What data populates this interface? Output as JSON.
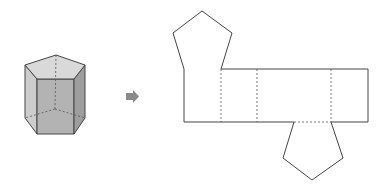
{
  "diagram": {
    "colors": {
      "stroke": "#444444",
      "dashed": "#666666",
      "arrow": "#8a8a8a",
      "face_top": "#d9d9d9",
      "face_left": "#cdcdcd",
      "face_front": "#b3b3b3",
      "face_right": "#9e9e9e"
    },
    "prism": {
      "label": "pentagonal-prism",
      "top_vertices": [
        [
          56,
          55
        ],
        [
          85,
          65
        ],
        [
          74,
          79
        ],
        [
          37,
          79
        ],
        [
          25,
          65
        ]
      ],
      "bottom_visible": [
        [
          25,
          118
        ],
        [
          37,
          134
        ],
        [
          74,
          134
        ],
        [
          85,
          118
        ]
      ],
      "hidden_vertex": [
        55,
        109
      ]
    },
    "arrow": {
      "label": "unfolds-to",
      "direction": "right"
    },
    "net": {
      "top_pentagon": [
        [
          184,
          69
        ],
        [
          173,
          33
        ],
        [
          202,
          11
        ],
        [
          232,
          33
        ],
        [
          221,
          69
        ]
      ],
      "left_rect": [
        [
          184,
          69
        ],
        [
          221,
          69
        ],
        [
          221,
          122
        ],
        [
          184,
          122
        ]
      ],
      "strip": {
        "x": [
          221,
          257,
          331,
          368
        ],
        "top": 69,
        "bottom": 122
      },
      "bottom_pentagon": [
        [
          294,
          122
        ],
        [
          331,
          122
        ],
        [
          343,
          158
        ],
        [
          312,
          180
        ],
        [
          283,
          158
        ]
      ]
    }
  }
}
